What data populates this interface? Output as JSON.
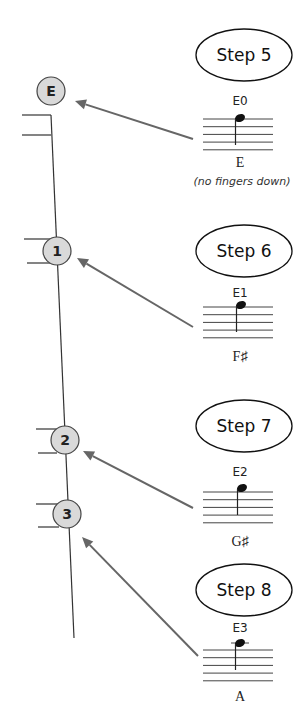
{
  "diagram": {
    "fingerboard": {
      "string_line": {
        "x1": 51,
        "y1": 115,
        "x2": 74,
        "y2": 638
      },
      "positions": [
        {
          "label": "E",
          "cx": 51,
          "cy": 91,
          "r": 14,
          "fret_lines": [
            {
              "x1": 22,
              "x2": 51,
              "y": 115
            },
            {
              "x1": 22,
              "x2": 51,
              "y": 135
            }
          ]
        },
        {
          "label": "1",
          "cx": 57,
          "cy": 251,
          "r": 14,
          "fret_lines": [
            {
              "x1": 24,
              "x2": 50,
              "y": 239
            },
            {
              "x1": 27,
              "x2": 50,
              "y": 263
            }
          ]
        },
        {
          "label": "2",
          "cx": 65,
          "cy": 440,
          "r": 14,
          "fret_lines": [
            {
              "x1": 36,
              "x2": 57,
              "y": 429
            },
            {
              "x1": 38,
              "x2": 57,
              "y": 453
            }
          ]
        },
        {
          "label": "3",
          "cx": 67,
          "cy": 514,
          "r": 14,
          "fret_lines": [
            {
              "x1": 36,
              "x2": 59,
              "y": 504
            },
            {
              "x1": 38,
              "x2": 59,
              "y": 527
            }
          ]
        }
      ]
    },
    "steps": [
      {
        "title": "Step 5",
        "ellipse": {
          "cx": 244,
          "cy": 55,
          "rx": 48,
          "ry": 26
        },
        "string_code": "E0",
        "code_y": 105,
        "staff_top": 119,
        "note": {
          "x": 240,
          "y": 118,
          "ledger": false
        },
        "note_name": "E",
        "name_y": 167,
        "hint": "(no fingers down)",
        "hint_y": 185,
        "arrow": {
          "x1": 193,
          "y1": 139,
          "x2": 75,
          "y2": 101
        }
      },
      {
        "title": "Step 6",
        "ellipse": {
          "cx": 244,
          "cy": 251,
          "rx": 48,
          "ry": 26
        },
        "string_code": "E1",
        "code_y": 297,
        "staff_top": 307,
        "note": {
          "x": 241,
          "y": 305,
          "ledger": false
        },
        "note_name": "F♯",
        "name_y": 361,
        "hint": "",
        "hint_y": 0,
        "arrow": {
          "x1": 193,
          "y1": 327,
          "x2": 77,
          "y2": 258
        }
      },
      {
        "title": "Step 7",
        "ellipse": {
          "cx": 244,
          "cy": 426,
          "rx": 48,
          "ry": 26
        },
        "string_code": "E2",
        "code_y": 476,
        "staff_top": 492,
        "note": {
          "x": 242,
          "y": 488,
          "ledger": false
        },
        "note_name": "G♯",
        "name_y": 546,
        "hint": "",
        "hint_y": 0,
        "arrow": {
          "x1": 193,
          "y1": 508,
          "x2": 83,
          "y2": 451
        }
      },
      {
        "title": "Step 8",
        "ellipse": {
          "cx": 244,
          "cy": 590,
          "rx": 48,
          "ry": 26
        },
        "string_code": "E3",
        "code_y": 632,
        "staff_top": 650,
        "note": {
          "x": 240,
          "y": 643,
          "ledger": true
        },
        "note_name": "A",
        "name_y": 701,
        "hint": "",
        "hint_y": 0,
        "arrow": {
          "x1": 198,
          "y1": 656,
          "x2": 82,
          "y2": 537
        }
      }
    ],
    "staff": {
      "x1": 203,
      "x2": 273,
      "spacing": 7.7,
      "lines": 5
    }
  }
}
